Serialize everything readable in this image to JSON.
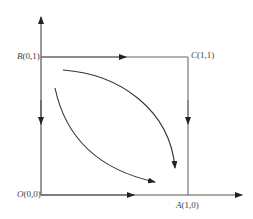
{
  "diagram": {
    "type": "phase-portrait",
    "points": {
      "O": {
        "name": "O",
        "coords": "(0,0)"
      },
      "A": {
        "name": "A",
        "coords": "(1,0)"
      },
      "B": {
        "name": "B",
        "coords": "(0,1)"
      },
      "C": {
        "name": "C",
        "coords": "(1,1)"
      }
    },
    "colors": {
      "line": "#333333",
      "edge": "#666666",
      "text": "#444444"
    }
  }
}
